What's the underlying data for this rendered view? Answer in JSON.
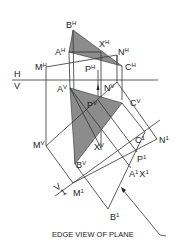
{
  "diagram": {
    "caption": "EDGE VIEW OF PLANE",
    "fold_lines": [
      {
        "id": "HV",
        "upper": "H",
        "lower": "V"
      },
      {
        "id": "V1",
        "upper": "V",
        "lower": "1"
      }
    ],
    "labels": {
      "BH": {
        "base": "B",
        "sup": "H"
      },
      "AH": {
        "base": "A",
        "sup": "H"
      },
      "XH": {
        "base": "X",
        "sup": "H"
      },
      "NH": {
        "base": "N",
        "sup": "H"
      },
      "MH": {
        "base": "M",
        "sup": "H"
      },
      "PH": {
        "base": "P",
        "sup": "H"
      },
      "CH": {
        "base": "C",
        "sup": "H"
      },
      "AV": {
        "base": "A",
        "sup": "V"
      },
      "NV": {
        "base": "N",
        "sup": "V"
      },
      "PV": {
        "base": "P",
        "sup": "V"
      },
      "CV": {
        "base": "C",
        "sup": "V"
      },
      "MV": {
        "base": "M",
        "sup": "V"
      },
      "XV": {
        "base": "X",
        "sup": "V"
      },
      "BV": {
        "base": "B",
        "sup": "V"
      },
      "C1": {
        "base": "C",
        "sup": "1"
      },
      "N1": {
        "base": "N",
        "sup": "1"
      },
      "P1": {
        "base": "P",
        "sup": "1"
      },
      "A1X1": {
        "base": "A",
        "sup": "1",
        "base2": "X",
        "sup2": "1"
      },
      "M1": {
        "base": "M",
        "sup": "1"
      },
      "B1": {
        "base": "B",
        "sup": "1"
      }
    },
    "colors": {
      "line": "#333333",
      "shade": "#8c8c8c",
      "background": "#ffffff"
    }
  }
}
